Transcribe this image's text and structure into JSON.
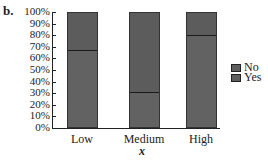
{
  "panel_label": "b.",
  "chart_data": {
    "type": "bar",
    "stacked": true,
    "percent": true,
    "title": "",
    "xlabel": "x",
    "ylabel": "",
    "categories": [
      "Low",
      "Medium",
      "High"
    ],
    "series": [
      {
        "name": "Yes",
        "values": [
          67,
          30,
          80
        ]
      },
      {
        "name": "No",
        "values": [
          33,
          70,
          20
        ]
      }
    ],
    "ylim": [
      0,
      100
    ],
    "yticks": [
      "0%",
      "10%",
      "20%",
      "30%",
      "40%",
      "50%",
      "60%",
      "70%",
      "80%",
      "90%",
      "100%"
    ],
    "legend": {
      "position": "right",
      "entries": [
        "No",
        "Yes"
      ]
    },
    "grid": false,
    "colors": {
      "no": "#5c5c5c",
      "yes": "#626262",
      "divider": "#1a1a1a"
    }
  }
}
